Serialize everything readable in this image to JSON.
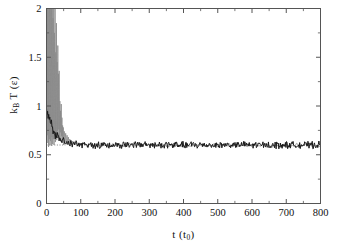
{
  "figure": {
    "name": "temperature-equilibration-plot",
    "background": "#ffffff",
    "frame_color": "#555555"
  },
  "axes": {
    "x_label_text": "t (t",
    "x_label_sub": "0",
    "x_label_close": ")",
    "y_label_text_k": "k",
    "y_label_sub_B": "B",
    "y_label_text_T": " T (",
    "y_label_eps": "ε",
    "y_label_close": ")"
  },
  "chart_data": {
    "type": "line",
    "title": "",
    "xlabel": "t (t0)",
    "ylabel": "kB T (eps)",
    "xlim": [
      0,
      800
    ],
    "ylim": [
      0,
      2
    ],
    "xticks": [
      0,
      100,
      200,
      300,
      400,
      500,
      600,
      700,
      800
    ],
    "xticklabels": [
      "0",
      "100",
      "200",
      "300",
      "400",
      "500",
      "600",
      "700",
      "800"
    ],
    "yticks": [
      0,
      0.5,
      1,
      1.5,
      2
    ],
    "yticklabels": [
      "0",
      "0.5",
      "1",
      "1.5",
      "2"
    ],
    "grid": false,
    "legend": null,
    "reference_line": {
      "name": "target-temperature-dotted-line",
      "y": 0.6,
      "style": "dotted",
      "color": "#777777",
      "x_start": 0,
      "x_end": 55
    },
    "series": [
      {
        "name": "instantaneous-temperature-gray",
        "color": "#8a8a8a",
        "width": 0.8,
        "clipped_at_top": true,
        "comment": "sharp spikes exceeding ylim=2 near t<40, then decaying oscillations",
        "x": [
          0,
          1,
          2,
          3,
          4,
          5,
          6,
          7,
          8,
          9,
          10,
          11,
          12,
          13,
          14,
          15,
          16,
          17,
          18,
          19,
          20,
          21,
          22,
          23,
          24,
          25,
          26,
          27,
          28,
          29,
          30,
          31,
          32,
          33,
          34,
          35,
          36,
          37,
          38,
          39,
          40,
          41,
          42,
          43,
          44,
          45,
          46,
          47,
          48,
          49,
          50,
          52,
          54,
          56,
          58,
          60,
          62,
          64,
          66,
          68,
          70,
          72,
          74,
          76,
          78,
          80,
          84,
          88,
          92,
          96,
          100
        ],
        "y": [
          0.85,
          2.6,
          0.7,
          2.9,
          0.62,
          3.4,
          0.58,
          2.2,
          0.66,
          2.8,
          0.6,
          2.45,
          0.64,
          3.1,
          0.59,
          2.0,
          0.68,
          2.35,
          0.61,
          1.9,
          0.66,
          2.6,
          0.6,
          1.75,
          0.7,
          2.1,
          0.63,
          1.55,
          0.72,
          1.85,
          0.65,
          1.45,
          0.74,
          1.62,
          0.67,
          1.33,
          0.76,
          1.36,
          0.66,
          1.05,
          0.73,
          0.95,
          0.64,
          1.02,
          0.69,
          0.88,
          0.62,
          0.8,
          0.66,
          0.78,
          0.6,
          0.74,
          0.63,
          0.72,
          0.61,
          0.7,
          0.62,
          0.68,
          0.6,
          0.66,
          0.61,
          0.65,
          0.6,
          0.64,
          0.61,
          0.63,
          0.6,
          0.62,
          0.6,
          0.61,
          0.6
        ]
      },
      {
        "name": "averaged-temperature-black",
        "color": "#1a1a1a",
        "width": 1.0,
        "comment": "decays from ~1.0 to plateau ~0.60 with noise, extends to t=800",
        "plateau_value": 0.6,
        "noise_amplitude": 0.03,
        "decay_start": 1.0,
        "decay_tau": 22
      }
    ]
  }
}
